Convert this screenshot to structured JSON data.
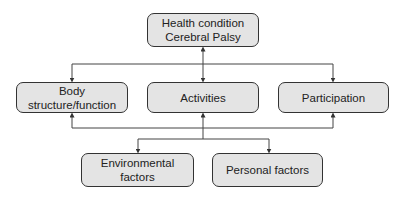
{
  "diagram": {
    "nodes": {
      "health": {
        "line1": "Health condition",
        "line2": "Cerebral Palsy"
      },
      "body": {
        "label": "Body structure/function"
      },
      "activities": {
        "label": "Activities"
      },
      "participation": {
        "label": "Participation"
      },
      "environmental": {
        "label": "Environmental factors"
      },
      "personal": {
        "label": "Personal factors"
      }
    },
    "edges": [
      {
        "from": "health",
        "to": "body",
        "bidirectional": true
      },
      {
        "from": "health",
        "to": "activities",
        "bidirectional": true
      },
      {
        "from": "health",
        "to": "participation",
        "bidirectional": true
      },
      {
        "from": "activities",
        "to": "body",
        "bidirectional": true
      },
      {
        "from": "activities",
        "to": "participation",
        "bidirectional": true
      },
      {
        "from": "activities",
        "to": "environmental",
        "bidirectional": true
      },
      {
        "from": "activities",
        "to": "personal",
        "bidirectional": true
      }
    ],
    "colors": {
      "box_fill": "#e4e4e4",
      "stroke": "#333333"
    }
  }
}
